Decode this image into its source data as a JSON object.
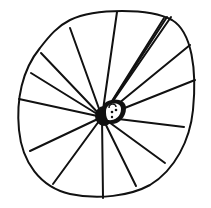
{
  "drawing": {
    "description": "Hand-drawn sketch of a circular web with radial lines converging on a small figure",
    "stroke_color": "#111111",
    "background": "#ffffff",
    "outline_path": "M 70 20 C 95 8, 150 8, 172 20 C 192 32, 197 70, 193 110 C 190 140, 175 170, 150 185 C 130 196, 98 200, 70 194 C 40 187, 22 162, 19 130 C 16 100, 22 70, 40 48 C 50 35, 58 26, 70 20 Z",
    "hub": {
      "x": 102,
      "y": 117
    },
    "spokes": [
      [
        117,
        12
      ],
      [
        70,
        28
      ],
      [
        41,
        53
      ],
      [
        31,
        73
      ],
      [
        19,
        99
      ],
      [
        30,
        151
      ],
      [
        53,
        184
      ],
      [
        103,
        198
      ],
      [
        136,
        186
      ],
      [
        165,
        163
      ],
      [
        184,
        127
      ],
      [
        195,
        80
      ],
      [
        190,
        45
      ],
      [
        171,
        17
      ],
      [
        167,
        17
      ],
      [
        164,
        18
      ]
    ],
    "figure": {
      "cx": 114,
      "cy": 108,
      "rx": 12,
      "ry": 13
    }
  }
}
